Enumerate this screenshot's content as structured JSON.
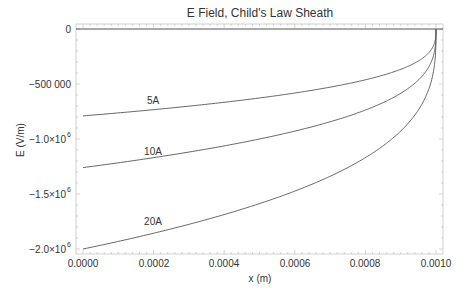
{
  "chart_data": {
    "type": "line",
    "title": "E Field, Child's Law Sheath",
    "xlabel": "x (m)",
    "ylabel": "E (V/m)",
    "xlim": [
      0,
      0.001
    ],
    "ylim": [
      -2000000,
      0
    ],
    "x_ticks": [
      "0.0000",
      "0.0002",
      "0.0004",
      "0.0006",
      "0.0008",
      "0.0010"
    ],
    "y_ticks": [
      "0",
      "-500000",
      "-1.0×10⁶",
      "-1.5×10⁶",
      "-2.0×10⁶"
    ],
    "grid": false,
    "legend": "inline labels",
    "x": [
      0,
      0.0001,
      0.0002,
      0.0003,
      0.0004,
      0.0005,
      0.0006,
      0.0007,
      0.0008,
      0.0009,
      0.00095,
      0.00099,
      0.001
    ],
    "series": [
      {
        "name": "5A",
        "E0": -790000,
        "values": [
          -790000,
          -762700,
          -733400,
          -701500,
          -666300,
          -627000,
          -582200,
          -529000,
          -462000,
          -366700,
          -291100,
          -170200,
          0
        ]
      },
      {
        "name": "10A",
        "E0": -1260000,
        "values": [
          -1260000,
          -1216500,
          -1169700,
          -1118800,
          -1062700,
          -1000100,
          -928600,
          -843700,
          -736800,
          -584900,
          -464200,
          -271500,
          0
        ]
      },
      {
        "name": "20A",
        "E0": -2000000,
        "values": [
          -2000000,
          -1930900,
          -1856700,
          -1775900,
          -1686800,
          -1587400,
          -1473600,
          -1339300,
          -1169600,
          -928300,
          -736800,
          -430900,
          0
        ]
      }
    ],
    "model": "E(x) = E0 * (1 - x/d)^(1/3), d = 0.001 m"
  },
  "labels": {
    "title": "E Field, Child's Law Sheath",
    "xlabel": "x (m)",
    "ylabel": "E (V/m)",
    "x_ticks": [
      "0.0000",
      "0.0002",
      "0.0004",
      "0.0006",
      "0.0008",
      "0.0010"
    ],
    "y_ticks": {
      "t0": "0",
      "t1": "−500 000",
      "t2": "−1.0×10",
      "t3": "−1.5×10",
      "t4": "−2.0×10",
      "exp": "6"
    },
    "curves": [
      "5A",
      "10A",
      "20A"
    ]
  }
}
